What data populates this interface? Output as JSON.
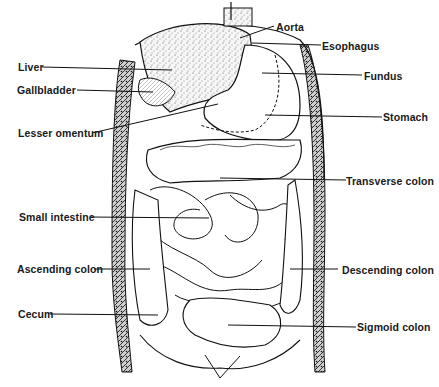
{
  "diagram": {
    "labels_left": [
      {
        "id": "liver",
        "text": "Liver"
      },
      {
        "id": "gallbladder",
        "text": "Gallbladder"
      },
      {
        "id": "lesser-omentum",
        "text": "Lesser omentum"
      },
      {
        "id": "small-intestine",
        "text": "Small intestine"
      },
      {
        "id": "ascending-colon",
        "text": "Ascending colon"
      },
      {
        "id": "cecum",
        "text": "Cecum"
      }
    ],
    "labels_right": [
      {
        "id": "aorta",
        "text": "Aorta"
      },
      {
        "id": "esophagus",
        "text": "Esophagus"
      },
      {
        "id": "fundus",
        "text": "Fundus"
      },
      {
        "id": "stomach",
        "text": "Stomach"
      },
      {
        "id": "transverse-colon",
        "text": "Transverse colon"
      },
      {
        "id": "descending-colon",
        "text": "Descending colon"
      },
      {
        "id": "sigmoid-colon",
        "text": "Sigmoid colon"
      }
    ]
  }
}
